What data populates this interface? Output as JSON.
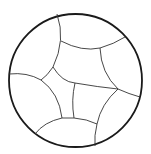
{
  "diagram": {
    "type": "hyperbolic-tiling-disk",
    "colors": {
      "background": "#ffffff",
      "boundary": "#1a1a1a",
      "edges": "#333333"
    },
    "boundary": {
      "cx": 75.5,
      "cy": 80.5,
      "r": 66.5
    },
    "edges": [
      {
        "id": "e1",
        "d": "M57,14 Q66,40 53,67"
      },
      {
        "id": "e2",
        "d": "M61,41 Q82,52 100,48"
      },
      {
        "id": "e3",
        "d": "M100,48 Q114,44 125,37"
      },
      {
        "id": "e4",
        "d": "M100,48 Q101,73 118,89"
      },
      {
        "id": "e5",
        "d": "M53,67 Q47,76 41,80"
      },
      {
        "id": "e6",
        "d": "M53,67 Q62,82 75,83"
      },
      {
        "id": "e7",
        "d": "M75,83 Q98,87 118,89"
      },
      {
        "id": "e8",
        "d": "M118,89 Q129,94 140,97"
      },
      {
        "id": "e9",
        "d": "M9,74 Q27,72 41,80"
      },
      {
        "id": "e10",
        "d": "M41,80 Q59,93 62,118"
      },
      {
        "id": "e11",
        "d": "M75,83 Q71,100 74,118"
      },
      {
        "id": "e12",
        "d": "M62,118 L74,118"
      },
      {
        "id": "e13",
        "d": "M118,89 Q101,104 97,124"
      },
      {
        "id": "e14",
        "d": "M74,118 Q87,119 97,124"
      },
      {
        "id": "e15",
        "d": "M62,118 Q44,122 35,134"
      },
      {
        "id": "e16",
        "d": "M97,124 Q94,136 95,146"
      }
    ]
  }
}
